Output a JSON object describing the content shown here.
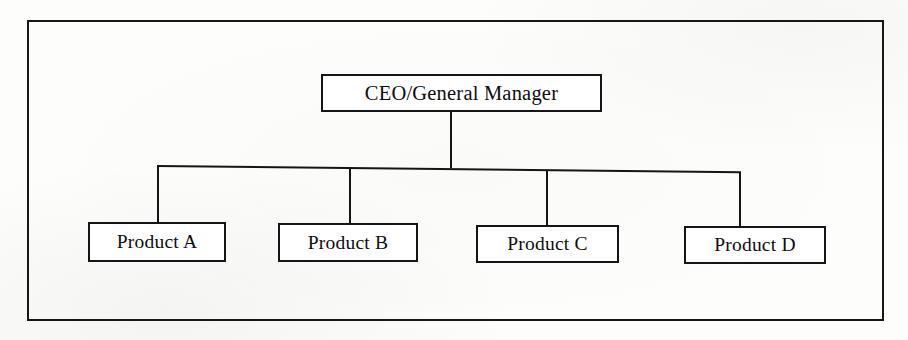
{
  "diagram": {
    "type": "organizational-chart",
    "layout": "product-based-structure",
    "frame": {
      "border_color": "#17171a"
    },
    "root": {
      "id": "ceo",
      "label": "CEO/General Manager"
    },
    "children": [
      {
        "id": "product-a",
        "label": "Product A"
      },
      {
        "id": "product-b",
        "label": "Product B"
      },
      {
        "id": "product-c",
        "label": "Product C"
      },
      {
        "id": "product-d",
        "label": "Product D"
      }
    ],
    "connectors": {
      "root_drop": "vertical",
      "bus": "horizontal",
      "legs": 4
    },
    "colors": {
      "stroke": "#151518",
      "box_fill": "#ffffff",
      "text": "#0d0d0f",
      "paper": "#fdfdfc"
    }
  }
}
